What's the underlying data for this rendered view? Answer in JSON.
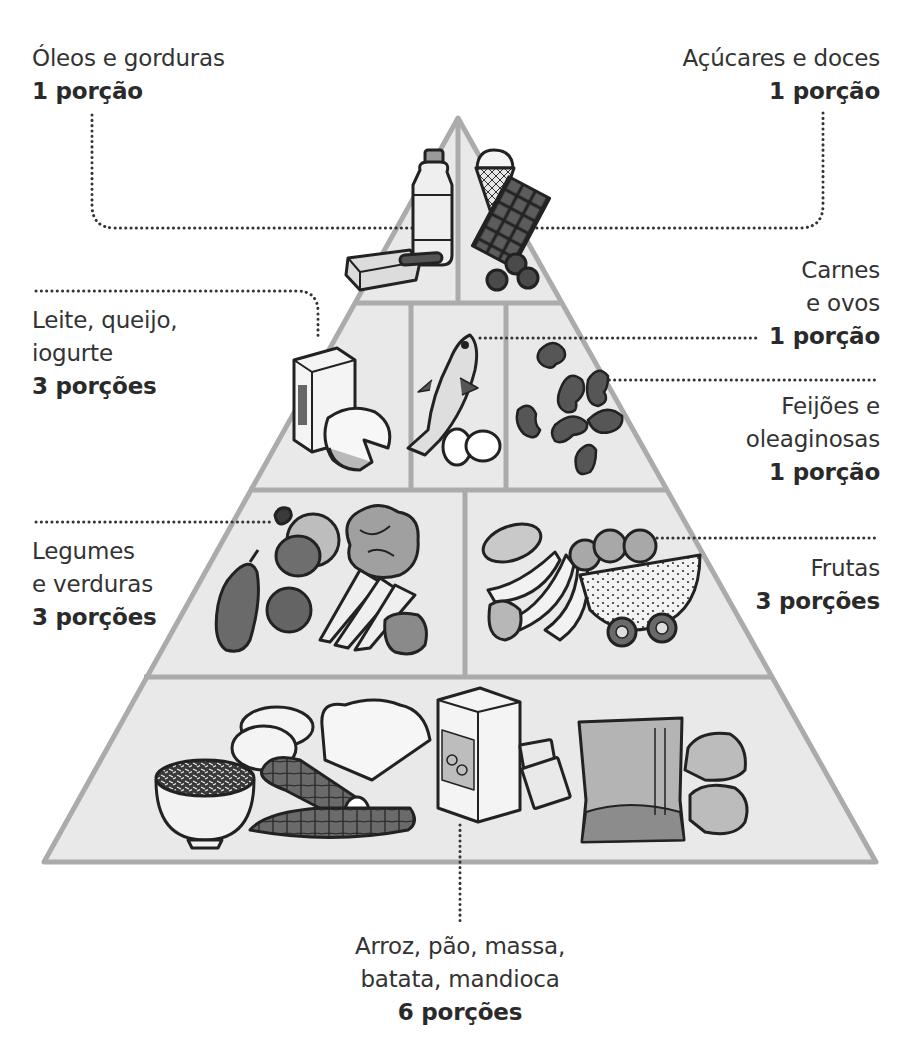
{
  "colors": {
    "pyramid_fill": "#e9e9e9",
    "pyramid_border": "#ababab",
    "text": "#333333",
    "outline": "#222222",
    "dark_food": "#5a5a5a",
    "mid_food": "#9a9a9a",
    "light_food": "#cfcfcf"
  },
  "groups": [
    {
      "id": "oleos",
      "tier": 1,
      "name_lines": [
        "Óleos e gorduras"
      ],
      "portion": "1 porção",
      "items": [
        "bottle-of-oil",
        "butter"
      ]
    },
    {
      "id": "acucares",
      "tier": 1,
      "name_lines": [
        "Açúcares e doces"
      ],
      "portion": "1 porção",
      "items": [
        "ice-cream-cone",
        "chocolate-bar",
        "berries"
      ]
    },
    {
      "id": "leite",
      "tier": 2,
      "name_lines": [
        "Leite, queijo,",
        "iogurte"
      ],
      "portion": "3 porções",
      "items": [
        "milk-carton",
        "cheese-wheel"
      ]
    },
    {
      "id": "carnes",
      "tier": 2,
      "name_lines": [
        "Carnes",
        "e ovos"
      ],
      "portion": "1 porção",
      "items": [
        "fish",
        "eggs"
      ]
    },
    {
      "id": "feijoes",
      "tier": 2,
      "name_lines": [
        "Feijões e",
        "oleaginosas"
      ],
      "portion": "1 porção",
      "items": [
        "beans"
      ]
    },
    {
      "id": "legumes",
      "tier": 3,
      "name_lines": [
        "Legumes",
        "e verduras"
      ],
      "portion": "3 porções",
      "items": [
        "eggplant",
        "onion",
        "tomato",
        "lettuce",
        "carrots",
        "pepper"
      ]
    },
    {
      "id": "frutas",
      "tier": 3,
      "name_lines": [
        "Frutas"
      ],
      "portion": "3 porções",
      "items": [
        "papaya",
        "bananas",
        "oranges",
        "watermelon",
        "kiwis",
        "apple"
      ]
    },
    {
      "id": "arroz",
      "tier": 4,
      "name_lines": [
        "Arroz, pão, massa,",
        "batata, mandioca"
      ],
      "portion": "6 porções",
      "items": [
        "rice-bowl",
        "potatoes",
        "bread",
        "cassava",
        "cereal-box",
        "crackers",
        "pasta-bag",
        "bread-rolls"
      ]
    }
  ]
}
